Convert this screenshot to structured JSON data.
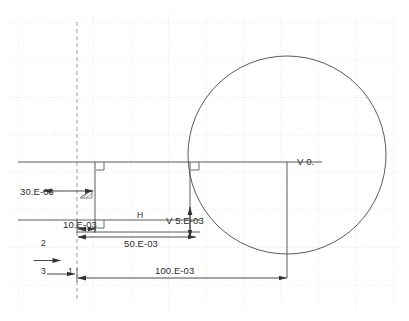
{
  "drawing": {
    "type": "cad-sketch-2d",
    "background_color": "#ffffff",
    "grid_color": "#c8c8d2",
    "geometry_color": "#555555",
    "dimension_color": "#2b2b2b",
    "grid": {
      "spacing_px": 37.5,
      "origin_x": 18,
      "origin_y": 22,
      "style": "dotted"
    },
    "circle": {
      "center_x": 287,
      "center_y": 155,
      "radius": 99
    },
    "axis_triad": {
      "vertical_label": "2",
      "origin_label": "3",
      "horizontal_label": "1"
    },
    "dimensions": [
      {
        "name": "vertical-height",
        "text": "30.E-03",
        "orientation": "vertical"
      },
      {
        "name": "small-width",
        "text": "10.E-03",
        "orientation": "horizontal"
      },
      {
        "name": "mid-width",
        "text": "50.E-03",
        "orientation": "horizontal"
      },
      {
        "name": "overall-width",
        "text": "100.E-03",
        "orientation": "horizontal"
      },
      {
        "name": "vertical-offset",
        "text": "V 5.E-03",
        "orientation": "vertical"
      }
    ],
    "annotations": [
      {
        "name": "horizontal-constraint",
        "text": "H"
      },
      {
        "name": "vertical-zero-constraint",
        "text": "V 0."
      }
    ]
  }
}
